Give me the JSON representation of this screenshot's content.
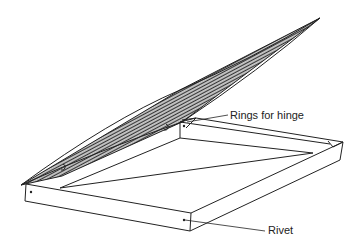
{
  "diagram": {
    "labels": {
      "rings": "Rings for hinge",
      "rivet": "Rivet"
    },
    "colors": {
      "line": "#222222",
      "mesh": "#333333",
      "background": "#ffffff"
    }
  }
}
